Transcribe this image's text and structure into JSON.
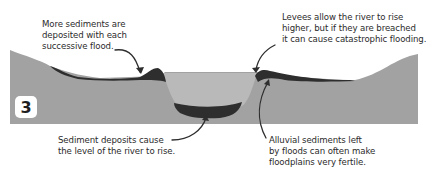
{
  "figure": {
    "step_number": "3",
    "colors": {
      "ground": "#a2a2a2",
      "water": "#b9b9b9",
      "sediment": "#2e2e2e",
      "text": "#2b2b2b",
      "background": "#ffffff"
    }
  },
  "annotations": {
    "top_left": "More sediments are\ndeposited with each\nsuccessive flood.",
    "top_right": "Levees allow the river to rise\nhigher, but if they are breached\nit can cause catastrophic flooding.",
    "bottom_left": "Sediment deposits cause\nthe level of the river to rise.",
    "bottom_right": "Alluvial sediments left\nby floods can often make\nfloodplains very fertile."
  }
}
